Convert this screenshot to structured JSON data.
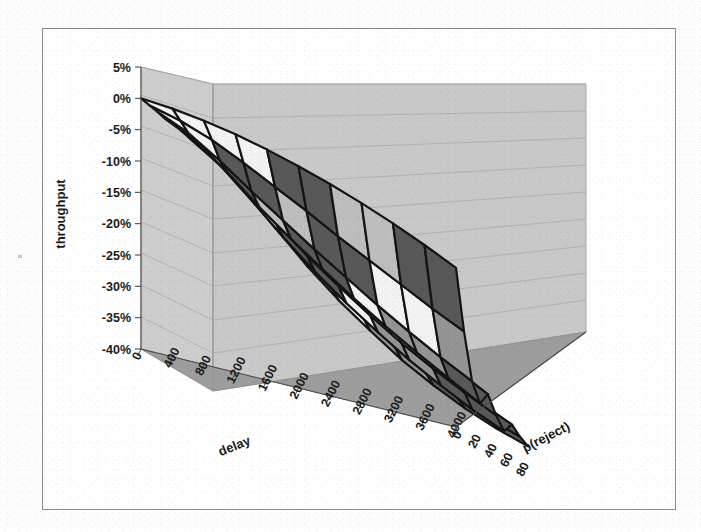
{
  "chart_data": {
    "type": "surface",
    "title": "",
    "xlabel": "delay",
    "ylabel": "throughput",
    "zlabel": "p(reject)",
    "grid": true,
    "legend": "none",
    "projection": "3d-wireframe-surface",
    "y_axis": {
      "label": "throughput",
      "ticks": [
        "5%",
        "0%",
        "-5%",
        "-10%",
        "-15%",
        "-20%",
        "-25%",
        "-30%",
        "-35%",
        "-40%"
      ],
      "values": [
        5,
        0,
        -5,
        -10,
        -15,
        -20,
        -25,
        -30,
        -35,
        -40
      ],
      "ylim": [
        -40,
        5
      ],
      "unit": "percent"
    },
    "x_axis": {
      "label": "delay",
      "ticks": [
        "0",
        "400",
        "800",
        "1200",
        "1600",
        "2000",
        "2400",
        "2800",
        "3200",
        "3600",
        "4000"
      ],
      "values": [
        0,
        400,
        800,
        1200,
        1600,
        2000,
        2400,
        2800,
        3200,
        3600,
        4000
      ],
      "xlim": [
        0,
        4000
      ]
    },
    "z_axis": {
      "label": "p(reject)",
      "ticks": [
        "0",
        "20",
        "40",
        "60",
        "80"
      ],
      "values": [
        0,
        20,
        40,
        60,
        80
      ],
      "zlim": [
        0,
        90
      ]
    },
    "bands": [
      {
        "range": "0% to 5%",
        "color": "#1e1e1e"
      },
      {
        "range": "-5% to 0%",
        "color": "#f4f4f4"
      },
      {
        "range": "-10% to -5%",
        "color": "#565656"
      },
      {
        "range": "-15% to -10%",
        "color": "#b9b9b9"
      },
      {
        "range": "-20% to -15%",
        "color": "#565656"
      },
      {
        "range": "-25% to -20%",
        "color": "#f4f4f4"
      },
      {
        "range": "-30% to -25%",
        "color": "#8f8f8f"
      },
      {
        "range": "-40% to -30%",
        "color": "#565656"
      }
    ],
    "z_values": [
      [
        0.0,
        -0.3,
        -0.6,
        -1.0,
        -0.8,
        -1.4,
        -1.8,
        -1.5,
        -2.2,
        -2.6
      ],
      [
        -0.4,
        -1.6,
        -2.8,
        -3.4,
        -3.0,
        -4.2,
        -5.0,
        -4.4,
        -5.6,
        -6.4
      ],
      [
        -1.1,
        -3.4,
        -6.0,
        -7.2,
        -6.4,
        -8.0,
        -9.4,
        -8.6,
        -10.2,
        -11.6
      ],
      [
        -2.0,
        -5.8,
        -9.6,
        -11.4,
        -10.2,
        -12.4,
        -14.0,
        -13.0,
        -14.8,
        -16.4
      ],
      [
        -3.2,
        -8.4,
        -13.0,
        -15.2,
        -13.8,
        -16.4,
        -18.2,
        -17.0,
        -19.0,
        -20.6
      ],
      [
        -4.6,
        -11.0,
        -16.4,
        -18.8,
        -17.2,
        -20.0,
        -22.0,
        -20.6,
        -22.6,
        -24.2
      ],
      [
        -6.2,
        -13.8,
        -19.6,
        -22.2,
        -20.4,
        -23.4,
        -25.4,
        -23.8,
        -26.0,
        -27.6
      ],
      [
        -8.0,
        -16.4,
        -22.8,
        -25.4,
        -23.6,
        -26.6,
        -28.6,
        -27.0,
        -29.0,
        -30.4
      ],
      [
        -10.0,
        -19.0,
        -25.8,
        -28.4,
        -26.4,
        -29.4,
        -31.4,
        -29.8,
        -31.6,
        -32.8
      ],
      [
        -12.2,
        -21.6,
        -28.6,
        -31.2,
        -29.2,
        -32.0,
        -34.0,
        -32.2,
        -33.8,
        -34.8
      ],
      [
        -14.6,
        -24.0,
        -31.2,
        -34.0,
        -31.8,
        -34.4,
        -36.2,
        -34.4,
        -35.6,
        -36.4
      ]
    ],
    "surface_note": "throughput degradation grid over delay (ms) x p(reject) (%)"
  },
  "axes": {
    "throughput_title": "throughput",
    "delay_title": "delay",
    "preject_title": "p(reject)"
  }
}
